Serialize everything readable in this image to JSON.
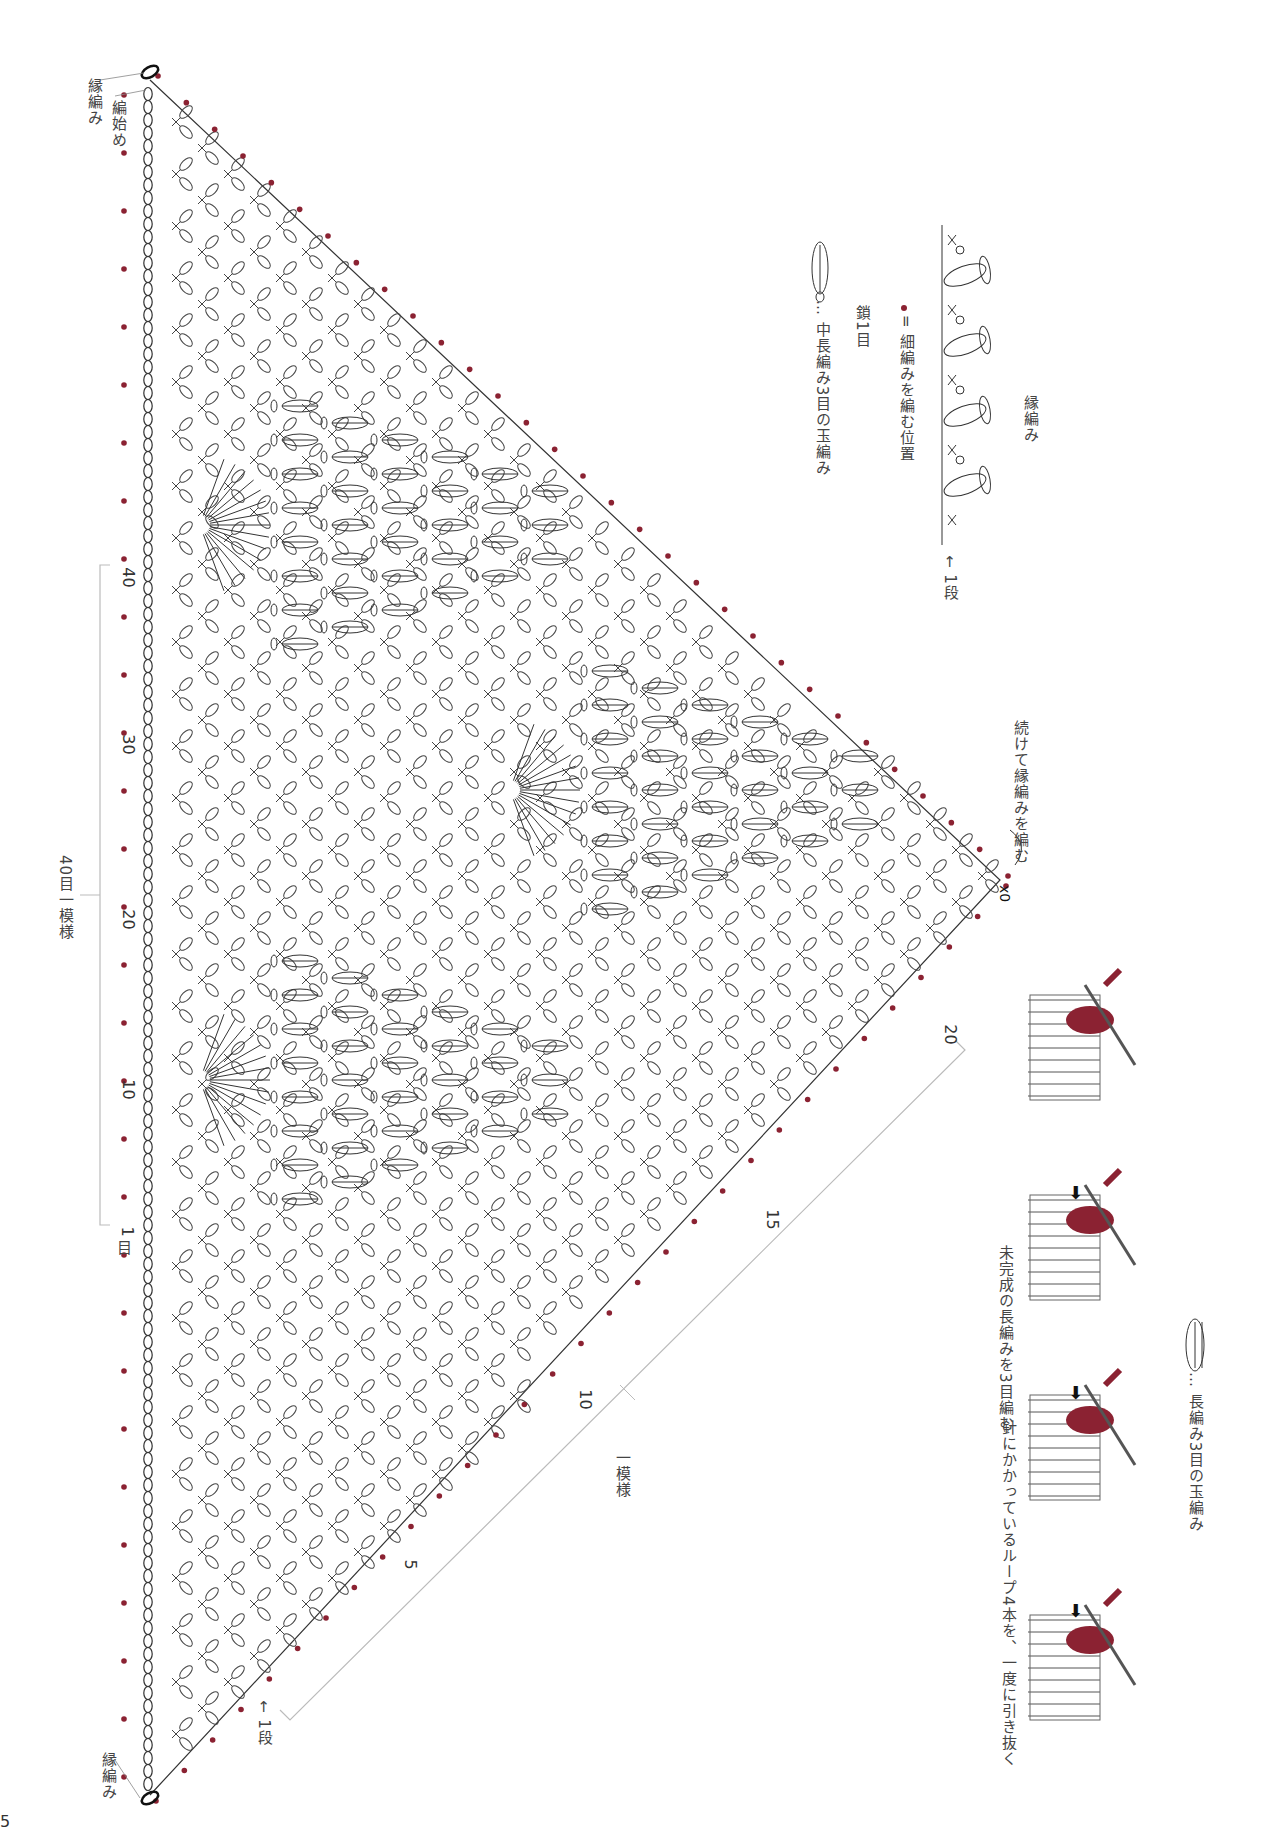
{
  "page": {
    "number": "5"
  },
  "chart": {
    "edge_label_top": "縁編み",
    "start_label": "編始め",
    "edge_label_bottom": "縁編み",
    "row1_label": "← 1段",
    "continue_label": "続けて縁編みを編む",
    "foundation_numbers": [
      "40",
      "30",
      "20",
      "10",
      "1"
    ],
    "foundation_unit": "目",
    "repeat_40_label": "40目一模様",
    "row_numbers": [
      "20",
      "15",
      "10",
      "5"
    ],
    "repeat_label": "一模様",
    "zero_marks": [
      "0",
      "0"
    ]
  },
  "edging_legend": {
    "title": "縁編み",
    "row_label": "← 1段",
    "dot_meaning": "= 細編みを編む位置",
    "chain_label": "鎖1目",
    "puff_label": "… 中長編み3目の玉編み"
  },
  "cluster_legend": {
    "title": "… 長編み3目の玉編み",
    "steps": [
      {
        "caption": ""
      },
      {
        "caption": "未完成の長編みを3目編む"
      },
      {
        "caption": "針にかかっているループ4本を、一度に引き抜く"
      },
      {
        "caption": ""
      }
    ]
  },
  "colors": {
    "dot": "#8b2232",
    "yarn": "#8b2232",
    "line": "#333333",
    "bracket": "#bbbbbb"
  }
}
